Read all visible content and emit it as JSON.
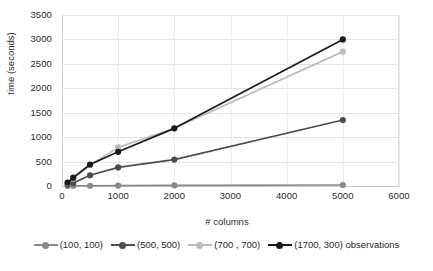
{
  "chart_data": {
    "type": "line",
    "title": "",
    "xlabel": "# columns",
    "ylabel": "time (seconds)",
    "xlim": [
      0,
      6000
    ],
    "ylim": [
      0,
      3500
    ],
    "xticks": [
      0,
      1000,
      2000,
      3000,
      4000,
      5000,
      6000
    ],
    "yticks": [
      0,
      500,
      1000,
      1500,
      2000,
      2500,
      3000,
      3500
    ],
    "grid": true,
    "legend_position": "bottom",
    "legend_suffix": "observations",
    "x": [
      100,
      200,
      500,
      1000,
      2000,
      5000
    ],
    "series": [
      {
        "name": "(100, 100)",
        "color": "#8a8a8a",
        "values": [
          2,
          3,
          5,
          8,
          12,
          20
        ]
      },
      {
        "name": "(500, 500)",
        "color": "#4d4d4d",
        "values": [
          30,
          60,
          220,
          380,
          540,
          1350
        ]
      },
      {
        "name": "(700 , 700)",
        "color": "#bdbdbd",
        "values": [
          60,
          150,
          430,
          790,
          1180,
          2750
        ]
      },
      {
        "name": "(1700, 300) observations",
        "color": "#1a1a1a",
        "values": [
          70,
          170,
          440,
          700,
          1180,
          3000
        ]
      }
    ]
  }
}
